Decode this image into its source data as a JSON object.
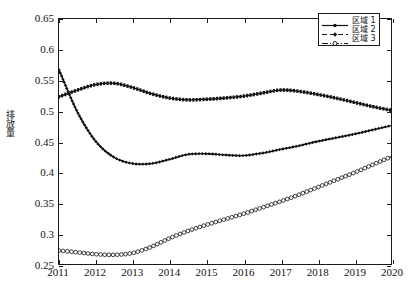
{
  "chart_data": {
    "type": "line",
    "title": "",
    "xlabel": "",
    "ylabel": "排放量",
    "xlim": [
      2011,
      2020
    ],
    "ylim": [
      0.25,
      0.65
    ],
    "grid": false,
    "legend_position": "top-right",
    "xticks": [
      "2011",
      "2012",
      "2013",
      "2014",
      "2015",
      "2016",
      "2017",
      "2018",
      "2019",
      "2020"
    ],
    "yticks": [
      "0.25",
      "0.3",
      "0.35",
      "0.4",
      "0.45",
      "0.5",
      "0.55",
      "0.6",
      "0.65"
    ],
    "x": [
      2011,
      2011.5,
      2012,
      2012.5,
      2013,
      2013.5,
      2014,
      2014.5,
      2015,
      2015.5,
      2016,
      2016.5,
      2017,
      2017.5,
      2018,
      2018.5,
      2019,
      2019.5,
      2020
    ],
    "series": [
      {
        "name": "区域 1",
        "marker": "dot",
        "linestyle": "solid",
        "color": "#111111",
        "values": [
          0.523,
          0.534,
          0.543,
          0.545,
          0.538,
          0.528,
          0.521,
          0.518,
          0.519,
          0.521,
          0.524,
          0.529,
          0.534,
          0.532,
          0.527,
          0.521,
          0.514,
          0.507,
          0.501
        ]
      },
      {
        "name": "区域 2",
        "marker": "diamond",
        "linestyle": "dashed",
        "color": "#111111",
        "values": [
          0.567,
          0.498,
          0.45,
          0.424,
          0.414,
          0.414,
          0.421,
          0.429,
          0.43,
          0.428,
          0.427,
          0.431,
          0.437,
          0.443,
          0.45,
          0.456,
          0.462,
          0.469,
          0.476
        ]
      },
      {
        "name": "区域 3",
        "marker": "circle",
        "linestyle": "dashdot",
        "color": "#111111",
        "values": [
          0.272,
          0.269,
          0.266,
          0.265,
          0.268,
          0.278,
          0.292,
          0.304,
          0.314,
          0.323,
          0.332,
          0.342,
          0.352,
          0.363,
          0.375,
          0.387,
          0.399,
          0.412,
          0.425
        ]
      }
    ]
  },
  "legend": {
    "items": [
      {
        "label": "区域 1"
      },
      {
        "label": "区域 2"
      },
      {
        "label": "区域 3"
      }
    ]
  }
}
